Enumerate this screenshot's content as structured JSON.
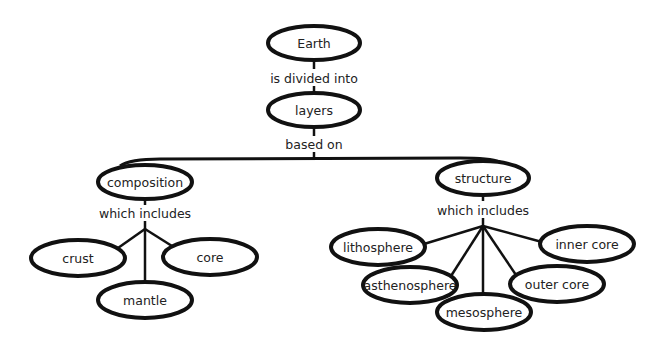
{
  "diagram": {
    "type": "concept-map",
    "nodes": {
      "earth": {
        "label": "Earth",
        "cx": 314,
        "cy": 43,
        "rx": 46,
        "ry": 17
      },
      "layers": {
        "label": "layers",
        "cx": 314,
        "cy": 110,
        "rx": 46,
        "ry": 17
      },
      "composition": {
        "label": "composition",
        "cx": 145,
        "cy": 182,
        "rx": 47,
        "ry": 17
      },
      "structure": {
        "label": "structure",
        "cx": 483,
        "cy": 178,
        "rx": 46,
        "ry": 17
      },
      "crust": {
        "label": "crust",
        "cx": 78,
        "cy": 258,
        "rx": 47,
        "ry": 18
      },
      "mantle": {
        "label": "mantle",
        "cx": 145,
        "cy": 300,
        "rx": 47,
        "ry": 18
      },
      "core": {
        "label": "core",
        "cx": 210,
        "cy": 257,
        "rx": 47,
        "ry": 18
      },
      "lithosphere": {
        "label": "lithosphere",
        "cx": 378,
        "cy": 247,
        "rx": 47,
        "ry": 18
      },
      "asthenosphere": {
        "label": "asthenosphere",
        "cx": 410,
        "cy": 285,
        "rx": 47,
        "ry": 18
      },
      "mesosphere": {
        "label": "mesosphere",
        "cx": 484,
        "cy": 312,
        "rx": 47,
        "ry": 18
      },
      "outer_core": {
        "label": "outer core",
        "cx": 557,
        "cy": 284,
        "rx": 47,
        "ry": 18
      },
      "inner_core": {
        "label": "inner core",
        "cx": 587,
        "cy": 244,
        "rx": 47,
        "ry": 18
      }
    },
    "link_labels": {
      "earth_layers": "is divided into",
      "layers_split": "based on",
      "composition_includes": "which includes",
      "structure_includes": "which includes"
    },
    "edges": [
      {
        "from": "Earth",
        "to": "layers",
        "label": "is divided into"
      },
      {
        "from": "layers",
        "to": "composition",
        "label": "based on"
      },
      {
        "from": "layers",
        "to": "structure",
        "label": "based on"
      },
      {
        "from": "composition",
        "to": "crust",
        "label": "which includes"
      },
      {
        "from": "composition",
        "to": "mantle",
        "label": "which includes"
      },
      {
        "from": "composition",
        "to": "core",
        "label": "which includes"
      },
      {
        "from": "structure",
        "to": "lithosphere",
        "label": "which includes"
      },
      {
        "from": "structure",
        "to": "asthenosphere",
        "label": "which includes"
      },
      {
        "from": "structure",
        "to": "mesosphere",
        "label": "which includes"
      },
      {
        "from": "structure",
        "to": "outer core",
        "label": "which includes"
      },
      {
        "from": "structure",
        "to": "inner core",
        "label": "which includes"
      }
    ],
    "colors": {
      "stroke": "#111111",
      "text": "#222222",
      "background": "#ffffff"
    }
  }
}
